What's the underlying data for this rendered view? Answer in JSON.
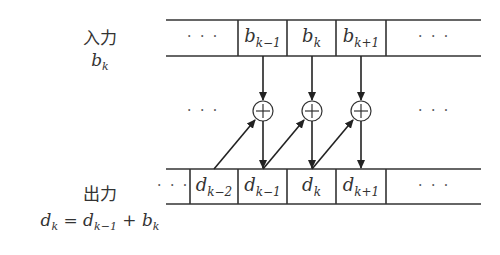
{
  "labels": {
    "input_title": "入力",
    "input_var": "b",
    "input_var_sub": "k",
    "output_title": "出力",
    "output_eq": {
      "lhs": "d",
      "lhs_sub": "k",
      "eq": " = ",
      "t1": "d",
      "t1_sub": "k−1",
      "plus": " + ",
      "t2": "b",
      "t2_sub": "k"
    }
  },
  "ellipsis": "· · ·",
  "input_row": {
    "cells": [
      {
        "base": "b",
        "sub": "k−1"
      },
      {
        "base": "b",
        "sub": "k"
      },
      {
        "base": "b",
        "sub": "k+1"
      }
    ]
  },
  "output_row": {
    "cells": [
      {
        "base": "d",
        "sub": "k−2"
      },
      {
        "base": "d",
        "sub": "k−1"
      },
      {
        "base": "d",
        "sub": "k"
      },
      {
        "base": "d",
        "sub": "k+1"
      }
    ]
  },
  "adders": {
    "symbol": "+",
    "count": 3
  }
}
